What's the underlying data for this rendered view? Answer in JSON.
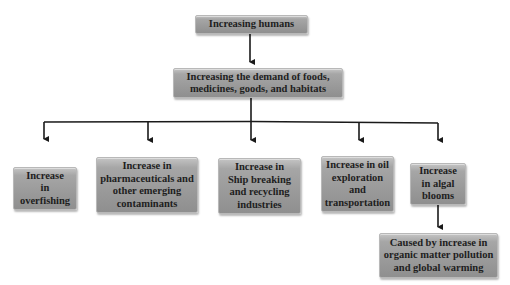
{
  "diagram": {
    "type": "flowchart",
    "root": {
      "label": "Increasing humans"
    },
    "level2": {
      "label": "Increasing the demand of foods,\nmedicines, goods, and habitats"
    },
    "branches": [
      {
        "label": "Increase\nin\noverfishing"
      },
      {
        "label": "Increase in\npharmaceuticals and\nother emerging\ncontaminants"
      },
      {
        "label": "Increase in\nShip breaking\nand recycling\nindustries"
      },
      {
        "label": "Increase in oil\nexploration\nand\ntransportation"
      },
      {
        "label": "Increase\nin algal\nblooms"
      }
    ],
    "sub_branch": {
      "parent": "Increase in algal blooms",
      "label": "Caused by increase in\norganic matter pollution\nand global warming"
    },
    "edges": [
      [
        "Increasing humans",
        "Increasing the demand of foods, medicines, goods, and habitats"
      ],
      [
        "Increasing the demand of foods, medicines, goods, and habitats",
        "Increase in overfishing"
      ],
      [
        "Increasing the demand of foods, medicines, goods, and habitats",
        "Increase in pharmaceuticals and other emerging contaminants"
      ],
      [
        "Increasing the demand of foods, medicines, goods, and habitats",
        "Increase in Ship breaking and recycling industries"
      ],
      [
        "Increasing the demand of foods, medicines, goods, and habitats",
        "Increase in oil exploration and transportation"
      ],
      [
        "Increasing the demand of foods, medicines, goods, and habitats",
        "Increase in algal blooms"
      ],
      [
        "Increase in algal blooms",
        "Caused by increase in organic matter pollution and global warming"
      ]
    ],
    "colors": {
      "box_fill": "#9e9e9e",
      "text": "#1e1e1e",
      "line": "#1a1a1a",
      "background": "#ffffff"
    }
  }
}
